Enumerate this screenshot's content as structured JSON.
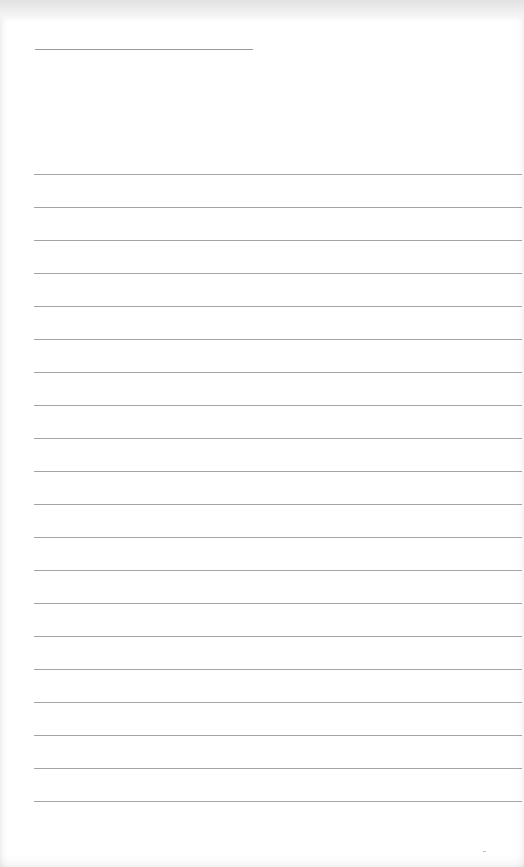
{
  "page": {
    "type": "blank lined paper",
    "title_line": {
      "present": true
    },
    "ruled_lines": {
      "count": 20,
      "first_y": 174,
      "spacing_px": 33
    },
    "colors": {
      "paper": "#ffffff",
      "line": "#a4a4a4",
      "title_line": "#9a9a9a"
    }
  }
}
